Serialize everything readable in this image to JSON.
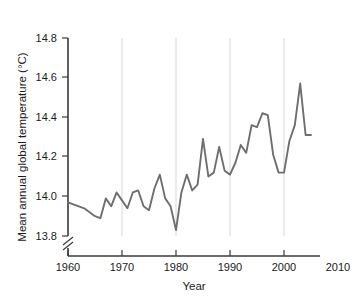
{
  "chart_data": {
    "type": "line",
    "title": "",
    "subtitle": "",
    "xlabel": "Year",
    "ylabel": "Mean annual global temperature (°C)",
    "xlim": [
      1960,
      2010
    ],
    "ylim": [
      13.8,
      14.8
    ],
    "y_axis_break": true,
    "y_axis_break_note": "axis broken below 13.8",
    "grid": "vertical-only",
    "legend": "none",
    "line_color": "#6e6e6e",
    "xticks": [
      1960,
      1970,
      1980,
      1990,
      2000,
      2010
    ],
    "xtick_labels": [
      "1960",
      "1970",
      "1980",
      "1990",
      "2000",
      "2010"
    ],
    "yticks": [
      13.8,
      14.0,
      14.2,
      14.4,
      14.6,
      14.8
    ],
    "ytick_labels": [
      "13.8",
      "14.0",
      "14.2",
      "14.4",
      "14.6",
      "14.8"
    ],
    "x": [
      1960,
      1961,
      1962,
      1963,
      1964,
      1965,
      1966,
      1967,
      1968,
      1969,
      1970,
      1971,
      1972,
      1973,
      1974,
      1975,
      1976,
      1977,
      1978,
      1979,
      1980,
      1981,
      1982,
      1983,
      1984,
      1985,
      1986,
      1987,
      1988,
      1989,
      1990,
      1991,
      1992,
      1993,
      1994,
      1995,
      1996,
      1997,
      1998,
      1999,
      2000,
      2001,
      2002,
      2003,
      2004,
      2005
    ],
    "values": [
      13.97,
      13.96,
      13.95,
      13.94,
      13.92,
      13.9,
      13.89,
      13.99,
      13.95,
      14.02,
      13.98,
      13.94,
      14.02,
      14.03,
      13.95,
      13.93,
      14.04,
      14.11,
      13.99,
      13.95,
      13.83,
      14.02,
      14.11,
      14.03,
      14.06,
      14.29,
      14.1,
      14.12,
      14.25,
      14.13,
      14.11,
      14.17,
      14.26,
      14.22,
      14.36,
      14.35,
      14.42,
      14.41,
      14.21,
      14.12,
      14.12,
      14.28,
      14.36,
      14.57,
      14.31,
      14.31
    ],
    "series": [
      {
        "name": "Mean annual global temperature",
        "color": "#6e6e6e",
        "values": [
          13.97,
          13.96,
          13.95,
          13.94,
          13.92,
          13.9,
          13.89,
          13.99,
          13.95,
          14.02,
          13.98,
          13.94,
          14.02,
          14.03,
          13.95,
          13.93,
          14.04,
          14.11,
          13.99,
          13.95,
          13.83,
          14.02,
          14.11,
          14.03,
          14.06,
          14.29,
          14.1,
          14.12,
          14.25,
          14.13,
          14.11,
          14.17,
          14.26,
          14.22,
          14.36,
          14.35,
          14.42,
          14.41,
          14.21,
          14.12,
          14.12,
          14.28,
          14.36,
          14.57,
          14.31,
          14.31
        ]
      }
    ],
    "annotations": []
  },
  "axis": {
    "x_title": "Year",
    "y_title": "Mean annual global temperature (°C)"
  },
  "xtick": {
    "t0": "1960",
    "t1": "1970",
    "t2": "1980",
    "t3": "1990",
    "t4": "2000",
    "t5": "2010"
  },
  "ytick": {
    "t0": "13.8",
    "t1": "14.0",
    "t2": "14.2",
    "t3": "14.4",
    "t4": "14.6",
    "t5": "14.8"
  }
}
